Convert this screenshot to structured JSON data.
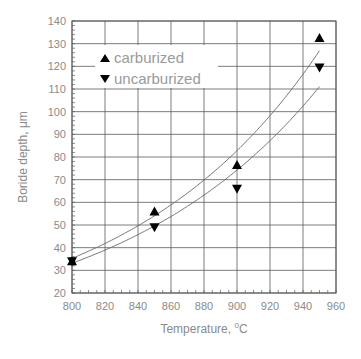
{
  "chart_data": {
    "type": "scatter",
    "title": "",
    "xlabel": "Temperature, °C",
    "xlabel_main": "Temperature, ",
    "xlabel_sup": "0",
    "xlabel_unit": "C",
    "ylabel": "Boride depth, μm",
    "xlim": [
      800,
      960
    ],
    "ylim": [
      20,
      140
    ],
    "x_ticks": [
      800,
      820,
      840,
      860,
      880,
      900,
      920,
      940,
      960
    ],
    "y_ticks": [
      20,
      30,
      40,
      50,
      60,
      70,
      80,
      90,
      100,
      110,
      120,
      130,
      140
    ],
    "grid": true,
    "legend_position": "upper left",
    "series": [
      {
        "name": "carburized",
        "marker": "triangle-up",
        "color": "#000000",
        "x": [
          800,
          850,
          900,
          950
        ],
        "values": [
          34,
          56,
          76.5,
          132.5
        ],
        "fit_curve": {
          "x": [
            800,
            850,
            900,
            950
          ],
          "y": [
            35,
            55,
            82,
            127
          ]
        }
      },
      {
        "name": "uncarburized",
        "marker": "triangle-down",
        "color": "#000000",
        "x": [
          800,
          850,
          900,
          950
        ],
        "values": [
          34,
          49,
          66,
          119.5
        ],
        "fit_curve": {
          "x": [
            800,
            850,
            900,
            950
          ],
          "y": [
            33,
            50,
            74,
            111
          ]
        }
      }
    ]
  },
  "legend": {
    "items": [
      {
        "label": "carburized",
        "marker": "triangle-up"
      },
      {
        "label": "uncarburized",
        "marker": "triangle-down"
      }
    ]
  },
  "colors": {
    "grid": "#5a5a5a",
    "text": "#8a8a8a",
    "curve": "#6a6a6a",
    "marker": "#000000"
  }
}
